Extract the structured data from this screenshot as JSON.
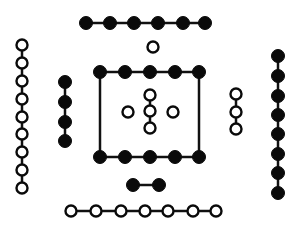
{
  "colors": {
    "black": "#0a0a0a",
    "white": "#ffffff",
    "line": "#111111"
  },
  "dot_radius": 6,
  "groups": [
    {
      "name": "top-black-chain",
      "value": 6,
      "fill": "black",
      "points": [
        [
          86,
          23
        ],
        [
          110,
          23
        ],
        [
          134,
          23
        ],
        [
          158,
          23
        ],
        [
          183,
          23
        ],
        [
          205,
          23
        ]
      ]
    },
    {
      "name": "top-single-white",
      "value": 1,
      "fill": "white",
      "points": [
        [
          153,
          47
        ]
      ]
    },
    {
      "name": "left-white-chain",
      "value": 9,
      "fill": "white",
      "points": [
        [
          22,
          45
        ],
        [
          22,
          63
        ],
        [
          22,
          81
        ],
        [
          22,
          99
        ],
        [
          22,
          117
        ],
        [
          22,
          134
        ],
        [
          22,
          152
        ],
        [
          22,
          170
        ],
        [
          22,
          188
        ]
      ]
    },
    {
      "name": "left-black-chain",
      "value": 4,
      "fill": "black",
      "points": [
        [
          65,
          82
        ],
        [
          65,
          102
        ],
        [
          65,
          122
        ],
        [
          65,
          141
        ]
      ]
    },
    {
      "name": "square-top-black",
      "value": 5,
      "fill": "black",
      "points": [
        [
          100,
          72
        ],
        [
          125,
          72
        ],
        [
          150,
          72
        ],
        [
          175,
          72
        ],
        [
          199,
          72
        ]
      ]
    },
    {
      "name": "square-bottom-black",
      "value": 5,
      "fill": "black",
      "points": [
        [
          100,
          157
        ],
        [
          125,
          157
        ],
        [
          150,
          157
        ],
        [
          175,
          157
        ],
        [
          199,
          157
        ]
      ]
    },
    {
      "name": "center-vertical-white",
      "value": 3,
      "fill": "white",
      "points": [
        [
          150,
          95
        ],
        [
          150,
          111
        ],
        [
          150,
          128
        ]
      ]
    },
    {
      "name": "center-left-white",
      "value": 1,
      "fill": "white",
      "points": [
        [
          128,
          112
        ]
      ]
    },
    {
      "name": "center-right-white",
      "value": 1,
      "fill": "white",
      "points": [
        [
          173,
          112
        ]
      ]
    },
    {
      "name": "right-white-chain",
      "value": 3,
      "fill": "white",
      "points": [
        [
          236,
          94
        ],
        [
          236,
          112
        ],
        [
          236,
          129
        ]
      ]
    },
    {
      "name": "right-black-chain",
      "value": 8,
      "fill": "black",
      "points": [
        [
          278,
          56
        ],
        [
          278,
          76
        ],
        [
          278,
          96
        ],
        [
          278,
          115
        ],
        [
          278,
          134
        ],
        [
          278,
          154
        ],
        [
          278,
          173
        ],
        [
          278,
          193
        ]
      ]
    },
    {
      "name": "bottom-black-pair",
      "value": 2,
      "fill": "black",
      "points": [
        [
          133,
          185
        ],
        [
          159,
          185
        ]
      ]
    },
    {
      "name": "bottom-white-chain",
      "value": 7,
      "fill": "white",
      "points": [
        [
          71,
          211
        ],
        [
          96,
          211
        ],
        [
          121,
          211
        ],
        [
          145,
          211
        ],
        [
          168,
          211
        ],
        [
          193,
          211
        ],
        [
          216,
          211
        ]
      ]
    }
  ],
  "square_frame": {
    "x1": 100,
    "y1": 72,
    "x2": 199,
    "y2": 157
  }
}
